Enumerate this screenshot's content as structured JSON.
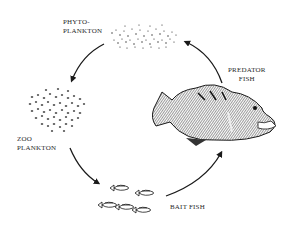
{
  "diagram": {
    "type": "food-chain-cycle",
    "nodes": [
      {
        "id": "phytoplankton",
        "label_lines": [
          "PHYTO-",
          "PLANKTON"
        ],
        "icon": "phytoplankton-dots-icon"
      },
      {
        "id": "zooplankton",
        "label_lines": [
          "ZOO",
          "PLANKTON"
        ],
        "icon": "zooplankton-cluster-icon"
      },
      {
        "id": "baitfish",
        "label_lines": [
          "BAIT FISH"
        ],
        "icon": "baitfish-school-icon"
      },
      {
        "id": "predator",
        "label_lines": [
          "PREDATOR",
          "FISH"
        ],
        "icon": "predator-fish-icon"
      }
    ],
    "edges": [
      {
        "from": "phytoplankton",
        "to": "zooplankton"
      },
      {
        "from": "zooplankton",
        "to": "baitfish"
      },
      {
        "from": "baitfish",
        "to": "predator"
      },
      {
        "from": "predator",
        "to": "phytoplankton"
      }
    ],
    "colors": {
      "ink": "#1a1a1a",
      "text": "#2a2a2a",
      "background": "#ffffff"
    }
  },
  "labels": {
    "phyto_1": "PHYTO-",
    "phyto_2": "PLANKTON",
    "zoo_1": "ZOO",
    "zoo_2": "PLANKTON",
    "bait": "BAIT FISH",
    "pred_1": "PREDATOR",
    "pred_2": "FISH"
  }
}
